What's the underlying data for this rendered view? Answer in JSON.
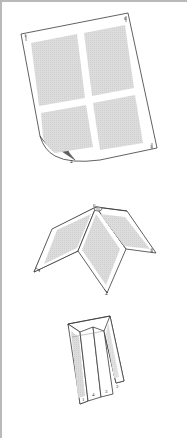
{
  "document": {
    "kind": "patent-line-drawing",
    "title": "Foldable multi-panel sheet assembly",
    "figure_count": 3,
    "background_color": "#ffffff",
    "line_color": "#3a3a3a",
    "panel_fill_color": "#d9d9d9",
    "panel_border_color": "#ffffff",
    "frame_color": "#b9b9b9",
    "shadow_color": "#6e6e6e"
  },
  "figures": [
    {
      "id": "figure-1",
      "name": "flat-sheet",
      "caption": "",
      "description": "Tilted flat rectangular sheet divided into four quadrant panels with a curled lower-left corner",
      "panel_count": 4,
      "panels": [
        {
          "id": "panel-top-left",
          "label": ""
        },
        {
          "id": "panel-top-right",
          "label": ""
        },
        {
          "id": "panel-bottom-left",
          "label": ""
        },
        {
          "id": "panel-bottom-right",
          "label": ""
        }
      ],
      "callouts": [
        {
          "id": "callout-1",
          "text": "1",
          "x": 24,
          "y": 36
        },
        {
          "id": "callout-6",
          "text": "6",
          "x": 126,
          "y": 19
        },
        {
          "id": "callout-5",
          "text": "5",
          "x": 153,
          "y": 148
        },
        {
          "id": "callout-4",
          "text": "4",
          "x": 72,
          "y": 165
        }
      ]
    },
    {
      "id": "figure-2",
      "name": "folded-tent",
      "caption": "",
      "description": "Same sheet creased along its center lines and opened into a tent or W configuration resting on its edges",
      "panel_count": 4,
      "panels": [
        {
          "id": "panel-left-outer",
          "label": ""
        },
        {
          "id": "panel-left-inner",
          "label": ""
        },
        {
          "id": "panel-right-inner",
          "label": ""
        },
        {
          "id": "panel-right-outer",
          "label": ""
        }
      ],
      "callouts": [
        {
          "id": "callout-6",
          "text": "6",
          "x": 96,
          "y": 209
        },
        {
          "id": "callout-5",
          "text": "5",
          "x": 152,
          "y": 251
        },
        {
          "id": "callout-1",
          "text": "1",
          "x": 41,
          "y": 272
        },
        {
          "id": "callout-4",
          "text": "4",
          "x": 107,
          "y": 294
        }
      ]
    },
    {
      "id": "figure-3",
      "name": "collapsed-stack",
      "caption": "",
      "description": "Sheet fully collapsed into a standing accordion stack of parallel leaves",
      "panel_count": 4,
      "panels": [
        {
          "id": "leaf-1",
          "label": ""
        },
        {
          "id": "leaf-2",
          "label": ""
        },
        {
          "id": "leaf-3",
          "label": ""
        },
        {
          "id": "leaf-4",
          "label": ""
        }
      ],
      "callouts": [
        {
          "id": "callout-1",
          "text": "1",
          "x": 85,
          "y": 398
        },
        {
          "id": "callout-4",
          "text": "4",
          "x": 95,
          "y": 392
        },
        {
          "id": "callout-3",
          "text": "3",
          "x": 108,
          "y": 389
        },
        {
          "id": "callout-2",
          "text": "2",
          "x": 119,
          "y": 384
        }
      ]
    }
  ]
}
